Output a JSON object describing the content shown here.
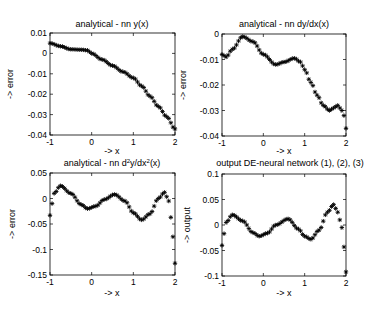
{
  "figure": {
    "width": 368,
    "height": 316,
    "marker": "*",
    "marker_color": "#000000",
    "background": "#ffffff"
  },
  "chart_data": [
    {
      "type": "scatter",
      "id": "y-error",
      "title": "analytical - nn y(x)",
      "xlabel": "-> x",
      "ylabel": "-> error",
      "xlim": [
        -1,
        2
      ],
      "ylim": [
        -0.04,
        0.01
      ],
      "xticks": [
        -1,
        0,
        1,
        2
      ],
      "xtick_labels": [
        "-1",
        "0",
        "1",
        "2"
      ],
      "yticks": [
        0.01,
        0,
        -0.01,
        -0.02,
        -0.03,
        -0.04
      ],
      "ytick_labels": [
        "0.01",
        "0",
        "-0.01",
        "-0.02",
        "-0.03",
        "-0.04"
      ],
      "grid": false,
      "frame": {
        "left": 50,
        "top": 33,
        "right": 175,
        "bottom": 135
      },
      "series": [
        {
          "name": "analytical - nn y(x)",
          "x": [
            -1,
            -0.75,
            -0.5,
            -0.25,
            -0.1,
            0,
            0.25,
            0.5,
            0.75,
            1,
            1.2,
            1.4,
            1.6,
            1.8,
            2
          ],
          "y": [
            0.005,
            0.0035,
            0.002,
            0.0018,
            0.0015,
            0.0,
            -0.003,
            -0.006,
            -0.009,
            -0.012,
            -0.016,
            -0.021,
            -0.026,
            -0.031,
            -0.037
          ]
        }
      ]
    },
    {
      "type": "scatter",
      "id": "dydx-error",
      "title": "analytical - nn dy/dx(x)",
      "xlabel": "-> x",
      "ylabel": "-> error",
      "xlim": [
        -1,
        2
      ],
      "ylim": [
        -0.04,
        0
      ],
      "xticks": [
        -1,
        0,
        1,
        2
      ],
      "xtick_labels": [
        "-1",
        "0",
        "1",
        "2"
      ],
      "yticks": [
        0,
        -0.01,
        -0.02,
        -0.03,
        -0.04
      ],
      "ytick_labels": [
        "0",
        "-0.01",
        "-0.02",
        "-0.03",
        "-0.04"
      ],
      "grid": false,
      "frame": {
        "left": 222,
        "top": 34,
        "right": 346,
        "bottom": 136
      },
      "series": [
        {
          "name": "analytical - nn dy/dx(x)",
          "x": [
            -1,
            -0.9,
            -0.75,
            -0.5,
            -0.25,
            0,
            0.3,
            0.5,
            0.75,
            0.9,
            1.0,
            1.15,
            1.3,
            1.45,
            1.6,
            1.7,
            1.8,
            1.9,
            1.95,
            2
          ],
          "y": [
            -0.008,
            -0.009,
            -0.006,
            -0.001,
            -0.003,
            -0.008,
            -0.012,
            -0.011,
            -0.0095,
            -0.011,
            -0.014,
            -0.019,
            -0.024,
            -0.028,
            -0.03,
            -0.029,
            -0.028,
            -0.03,
            -0.032,
            -0.037
          ]
        }
      ]
    },
    {
      "type": "scatter",
      "id": "d2ydx2-error",
      "title": "analytical - nn d²y/dx²(x)",
      "title_parts": {
        "pre": "analytical - nn d",
        "sup1": "2",
        "mid": "y/dx",
        "sup2": "2",
        "post": "(x)"
      },
      "xlabel": "-> x",
      "ylabel": "-> error",
      "xlim": [
        -1,
        2
      ],
      "ylim": [
        -0.15,
        0.05
      ],
      "xticks": [
        -1,
        0,
        1,
        2
      ],
      "xtick_labels": [
        "-1",
        "0",
        "1",
        "2"
      ],
      "yticks": [
        0.05,
        0,
        -0.05,
        -0.1,
        -0.15
      ],
      "ytick_labels": [
        "0.05",
        "0",
        "-0.05",
        "-0.1",
        "-0.15"
      ],
      "grid": false,
      "frame": {
        "left": 50,
        "top": 173,
        "right": 175,
        "bottom": 275
      },
      "series": [
        {
          "name": "analytical - nn d2y/dx2(x)",
          "x": [
            -1,
            -0.95,
            -0.9,
            -0.75,
            -0.5,
            -0.25,
            -0.1,
            0.1,
            0.3,
            0.55,
            0.8,
            1.0,
            1.2,
            1.4,
            1.6,
            1.75,
            1.85,
            1.9,
            1.95,
            2
          ],
          "y": [
            -0.033,
            -0.01,
            0.01,
            0.025,
            0.01,
            -0.012,
            -0.02,
            -0.015,
            -0.002,
            0.008,
            -0.005,
            -0.028,
            -0.042,
            -0.03,
            0.0,
            0.012,
            -0.005,
            -0.037,
            -0.075,
            -0.127
          ]
        }
      ]
    },
    {
      "type": "scatter",
      "id": "de-network-output",
      "title": "output DE-neural network (1), (2), (3)",
      "xlabel": "-> x",
      "ylabel": "-> output",
      "xlim": [
        -1,
        2
      ],
      "ylim": [
        -0.1,
        0.1
      ],
      "xticks": [
        -1,
        0,
        1,
        2
      ],
      "xtick_labels": [
        "-1",
        "0",
        "1",
        "2"
      ],
      "yticks": [
        0.1,
        0.05,
        0,
        -0.05,
        -0.1
      ],
      "ytick_labels": [
        "0.1",
        "0.05",
        "0",
        "-0.05",
        "-0.1"
      ],
      "grid": false,
      "frame": {
        "left": 222,
        "top": 174,
        "right": 346,
        "bottom": 276
      },
      "series": [
        {
          "name": "output DE-neural network",
          "x": [
            -1,
            -0.95,
            -0.9,
            -0.75,
            -0.5,
            -0.25,
            -0.1,
            0.1,
            0.3,
            0.6,
            0.85,
            1.0,
            1.15,
            1.35,
            1.55,
            1.7,
            1.8,
            1.9,
            1.95,
            2
          ],
          "y": [
            -0.04,
            -0.017,
            0.005,
            0.02,
            0.008,
            -0.015,
            -0.022,
            -0.016,
            0.0,
            0.012,
            -0.008,
            -0.022,
            -0.028,
            -0.01,
            0.025,
            0.04,
            0.025,
            -0.005,
            -0.043,
            -0.092
          ]
        }
      ]
    }
  ]
}
